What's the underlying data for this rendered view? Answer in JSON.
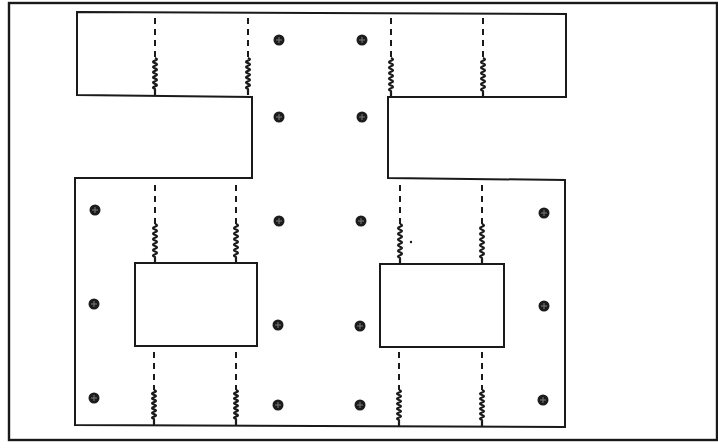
{
  "diagram": {
    "type": "mechanical-layout",
    "colors": {
      "line": "#1a1a1a",
      "background": "#ffffff",
      "screw": "#1c1c1c"
    },
    "frame": {
      "x": 9,
      "y": 3,
      "w": 708,
      "h": 437
    },
    "plates": [
      {
        "id": "upper-plate",
        "points": [
          [
            77,
            12
          ],
          [
            566,
            14
          ],
          [
            566,
            97
          ],
          [
            388,
            97
          ],
          [
            388,
            178
          ],
          [
            565,
            180
          ],
          [
            565,
            427
          ],
          [
            75,
            425
          ],
          [
            75,
            178
          ],
          [
            252,
            178
          ],
          [
            252,
            97
          ],
          [
            77,
            95
          ]
        ]
      }
    ],
    "cutouts": [
      {
        "id": "left-window",
        "x": 135,
        "y": 263,
        "w": 122,
        "h": 83
      },
      {
        "id": "right-window",
        "x": 380,
        "y": 264,
        "w": 124,
        "h": 83
      }
    ],
    "springs": [
      {
        "x": 155,
        "dash_from": 18,
        "dash_to": 58,
        "coil_from": 58,
        "coil_to": 95
      },
      {
        "x": 248,
        "dash_from": 18,
        "dash_to": 58,
        "coil_from": 58,
        "coil_to": 95
      },
      {
        "x": 391,
        "dash_from": 18,
        "dash_to": 58,
        "coil_from": 58,
        "coil_to": 97
      },
      {
        "x": 483,
        "dash_from": 18,
        "dash_to": 58,
        "coil_from": 58,
        "coil_to": 97
      },
      {
        "x": 155,
        "dash_from": 185,
        "dash_to": 224,
        "coil_from": 224,
        "coil_to": 263
      },
      {
        "x": 236,
        "dash_from": 185,
        "dash_to": 224,
        "coil_from": 224,
        "coil_to": 263
      },
      {
        "x": 400,
        "dash_from": 185,
        "dash_to": 224,
        "coil_from": 224,
        "coil_to": 264
      },
      {
        "x": 482,
        "dash_from": 185,
        "dash_to": 224,
        "coil_from": 224,
        "coil_to": 264
      },
      {
        "x": 154,
        "dash_from": 352,
        "dash_to": 390,
        "coil_from": 390,
        "coil_to": 425
      },
      {
        "x": 236,
        "dash_from": 352,
        "dash_to": 390,
        "coil_from": 390,
        "coil_to": 425
      },
      {
        "x": 399,
        "dash_from": 352,
        "dash_to": 390,
        "coil_from": 390,
        "coil_to": 426
      },
      {
        "x": 482,
        "dash_from": 352,
        "dash_to": 390,
        "coil_from": 390,
        "coil_to": 426
      }
    ],
    "screws": [
      {
        "x": 279,
        "y": 40
      },
      {
        "x": 362,
        "y": 40
      },
      {
        "x": 279,
        "y": 117
      },
      {
        "x": 362,
        "y": 117
      },
      {
        "x": 95,
        "y": 210
      },
      {
        "x": 279,
        "y": 221
      },
      {
        "x": 361,
        "y": 221
      },
      {
        "x": 544,
        "y": 213
      },
      {
        "x": 94,
        "y": 304
      },
      {
        "x": 278,
        "y": 325
      },
      {
        "x": 360,
        "y": 326
      },
      {
        "x": 544,
        "y": 306
      },
      {
        "x": 94,
        "y": 398
      },
      {
        "x": 278,
        "y": 405
      },
      {
        "x": 360,
        "y": 405
      },
      {
        "x": 543,
        "y": 400
      }
    ],
    "stray_marks": [
      {
        "x": 411,
        "y": 242
      }
    ]
  }
}
